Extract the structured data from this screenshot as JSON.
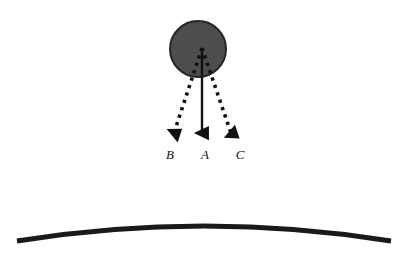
{
  "figure": {
    "background_color": "#ffffff",
    "width": 410,
    "height": 260,
    "ball": {
      "name": "ball",
      "center_x": 198,
      "center_y": 49,
      "radius": 28,
      "fill_color": "#4d4d4d",
      "stroke_color": "#262626",
      "stroke_width": 2
    },
    "origin": {
      "x": 202,
      "y": 48
    },
    "surface": {
      "name": "curved-surface",
      "description": "Shallow convex arc spanning the lower portion of the figure",
      "left_x": 17,
      "left_y": 241,
      "right_x": 391,
      "right_y": 241,
      "peak_x": 204,
      "peak_y": 226,
      "color": "#1a1a1a",
      "stroke_width": 5
    },
    "vectors": [
      {
        "id": "B",
        "label": "B",
        "style": "dotted",
        "color": "#111111",
        "start_x": 202,
        "start_y": 48,
        "end_x": 172,
        "end_y": 139,
        "label_x": 170,
        "label_y": 148
      },
      {
        "id": "A",
        "label": "A",
        "style": "solid",
        "color": "#111111",
        "start_x": 202,
        "start_y": 48,
        "end_x": 202,
        "end_y": 140,
        "label_x": 205,
        "label_y": 148
      },
      {
        "id": "C",
        "label": "C",
        "style": "dotted",
        "color": "#111111",
        "start_x": 202,
        "start_y": 48,
        "end_x": 233,
        "end_y": 139,
        "label_x": 240,
        "label_y": 148
      }
    ]
  }
}
